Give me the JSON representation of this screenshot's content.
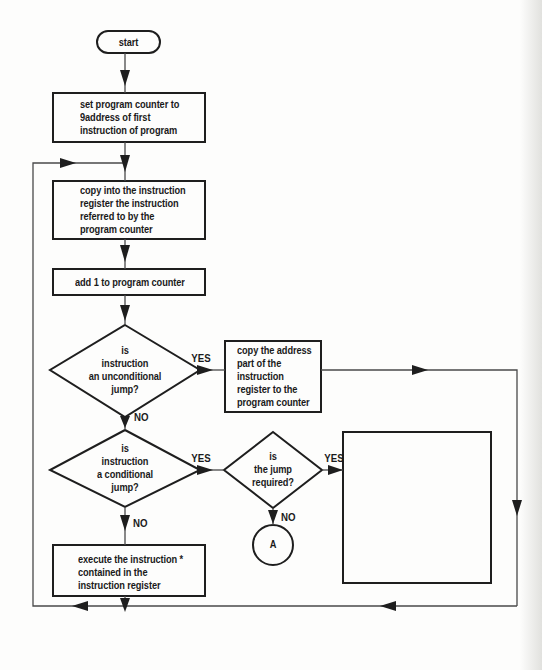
{
  "diagram": {
    "type": "flowchart",
    "stroke_color": "#1e1e1e",
    "line_color": "#555555",
    "nodes": {
      "start": {
        "shape": "terminal",
        "text": "start"
      },
      "set_pc": {
        "shape": "process",
        "lines": [
          "set program counter to",
          "9address of first",
          "instruction of program"
        ]
      },
      "fetch": {
        "shape": "process",
        "lines": [
          "copy into the instruction",
          "register the instruction",
          "referred to by the",
          "program counter"
        ]
      },
      "increment": {
        "shape": "process",
        "text": "add 1 to program counter"
      },
      "is_unconditional": {
        "shape": "decision",
        "lines": [
          "is",
          "instruction",
          "an unconditional",
          "jump?"
        ]
      },
      "copy_address": {
        "shape": "process",
        "lines": [
          "copy the address",
          "part of the",
          "instruction",
          "register to the",
          "program counter"
        ]
      },
      "is_conditional": {
        "shape": "decision",
        "lines": [
          "is",
          "instruction",
          "a conditional",
          "jump?"
        ]
      },
      "jump_required": {
        "shape": "decision",
        "lines": [
          "is",
          "the jump",
          "required?"
        ]
      },
      "blank_box": {
        "shape": "process",
        "text": ""
      },
      "connector_a": {
        "shape": "connector",
        "text": "A"
      },
      "execute": {
        "shape": "process",
        "lines": [
          "execute the instruction *",
          "contained in the",
          "instruction register"
        ]
      }
    },
    "edge_labels": {
      "unconditional_yes": "YES",
      "unconditional_no": "NO",
      "conditional_yes": "YES",
      "conditional_no": "NO",
      "required_yes": "YES",
      "required_no": "NO"
    }
  }
}
